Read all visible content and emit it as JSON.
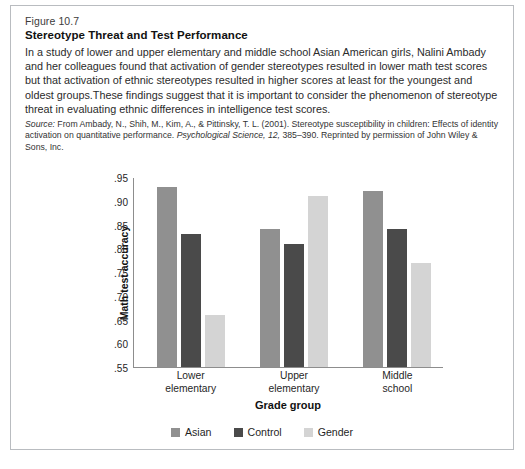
{
  "figure": {
    "number": "Figure 10.7",
    "title": "Stereotype Threat and Test Performance",
    "description": "In a study of lower and upper elementary and middle school Asian American girls, Nalini Ambady and her colleagues found that activation of gender stereotypes resulted in lower math test scores but that activation of ethnic stereotypes resulted in higher scores at least for the youngest and oldest groups.These findings suggest that it is important to consider the phenomenon of stereotype threat in evaluating ethnic differences in intelligence test scores.",
    "source_label": "Source:",
    "source_part1": " From Ambady, N., Shih, M., Kim, A., & Pittinsky, T. L. (2001). Stereotype susceptibility in children: Effects of identity activation on quantitative performance. ",
    "source_journal": "Psychological Science, 12,",
    "source_part2": " 385–390. Reprinted by permission of John Wiley & Sons, Inc."
  },
  "chart_data": {
    "type": "bar",
    "title": "",
    "xlabel": "Grade group",
    "ylabel": "Math test accuracy",
    "categories": [
      "Lower elementary",
      "Upper elementary",
      "Middle school"
    ],
    "category_lines": [
      [
        "Lower",
        "elementary"
      ],
      [
        "Upper",
        "elementary"
      ],
      [
        "Middle",
        "school"
      ]
    ],
    "series": [
      {
        "name": "Asian",
        "color": "#909090",
        "values": [
          0.93,
          0.84,
          0.92
        ]
      },
      {
        "name": "Control",
        "color": "#4a4a4a",
        "values": [
          0.83,
          0.81,
          0.84
        ]
      },
      {
        "name": "Gender",
        "color": "#d4d4d4",
        "values": [
          0.66,
          0.91,
          0.77
        ]
      }
    ],
    "ylim": [
      0.55,
      0.95
    ],
    "ytick_values": [
      0.95,
      0.9,
      0.85,
      0.8,
      0.75,
      0.7,
      0.65,
      0.6,
      0.55
    ],
    "ytick_labels": [
      ".95",
      ".90",
      ".85",
      ".80",
      ".75",
      ".70",
      ".65",
      ".60",
      ".55"
    ],
    "grid": false,
    "legend_position": "bottom"
  }
}
